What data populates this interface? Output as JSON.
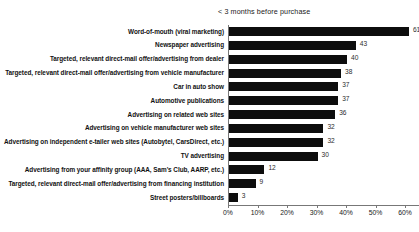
{
  "chart_data": {
    "type": "bar",
    "orientation": "horizontal",
    "title": "< 3 months before purchase",
    "xlabel": "",
    "ylabel": "",
    "xlim": [
      0,
      65
    ],
    "xticks": [
      0,
      10,
      20,
      30,
      40,
      50,
      60
    ],
    "xtick_labels": [
      "0%",
      "10%",
      "20%",
      "30%",
      "40%",
      "50%",
      "60%"
    ],
    "grid": false,
    "legend": false,
    "bar_color": "#0d0d0d",
    "axis_color": "#777777",
    "categories": [
      "Word-of-mouth (viral marketing)",
      "Newspaper advertising",
      "Targeted, relevant direct-mail offer/advertising from dealer",
      "Targeted, relevant direct-mail offer/advertising from vehicle manufacturer",
      "Car in auto show",
      "Automotive publications",
      "Advertising on related web sites",
      "Advertising on vehicle manufacturer web sites",
      "Advertising on independent e-tailer web sites (Autobytel, CarsDirect, etc.)",
      "TV advertising",
      "Advertising from your affinity group (AAA, Sam's Club, AARP, etc.)",
      "Targeted, relevant direct-mail offer/advertising from financing institution",
      "Street posters/billboards"
    ],
    "values": [
      61,
      43,
      40,
      38,
      37,
      37,
      36,
      32,
      32,
      30,
      12,
      9,
      3
    ],
    "value_labels": [
      "61",
      "43",
      "40",
      "38",
      "37",
      "37",
      "36",
      "32",
      "32",
      "30",
      "12",
      "9",
      "3"
    ]
  }
}
